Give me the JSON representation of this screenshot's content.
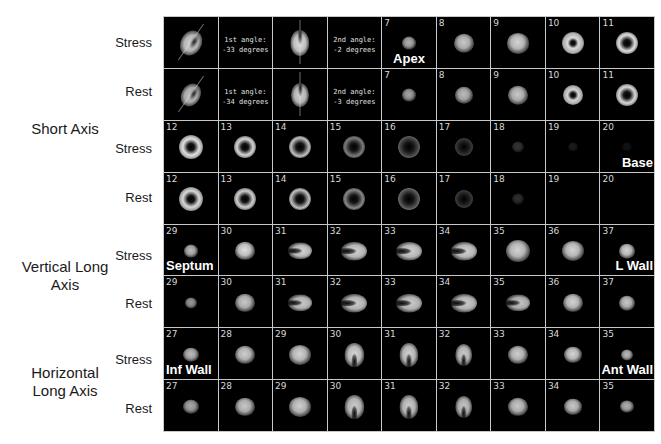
{
  "figure": {
    "group_labels": [
      {
        "id": "short-axis",
        "text": "Short Axis"
      },
      {
        "id": "vertical-long-axis",
        "line1": "Vertical Long",
        "line2": "Axis"
      },
      {
        "id": "horizontal-long-axis",
        "line1": "Horizontal",
        "line2": "Long Axis"
      }
    ],
    "row_labels": [
      "Stress",
      "Rest",
      "Stress",
      "Rest",
      "Stress",
      "Rest",
      "Stress",
      "Rest"
    ],
    "colors": {
      "background": "#ffffff",
      "cell_background": "#000000",
      "grid_lines": "#c8c8c8",
      "label_text": "#1a1a1a",
      "overlay_text": "#ffffff"
    },
    "rows": [
      {
        "label": "Stress",
        "cells": [
          {
            "num": "",
            "shape": "tilted",
            "size": 26,
            "b": 0.9
          },
          {
            "num": "",
            "shape": "text",
            "angle": "1st angle:\n-33 degrees"
          },
          {
            "num": "",
            "shape": "vshape",
            "size": 26,
            "b": 0.95
          },
          {
            "num": "",
            "shape": "text",
            "angle": "2nd angle:\n-2 degrees"
          },
          {
            "num": "7",
            "shape": "blob",
            "size": 14,
            "b": 0.75,
            "tag": "Apex",
            "tagpos": "bottom-center"
          },
          {
            "num": "8",
            "shape": "blob",
            "size": 20,
            "b": 0.85
          },
          {
            "num": "9",
            "shape": "blob",
            "size": 22,
            "b": 0.9
          },
          {
            "num": "10",
            "shape": "ring",
            "size": 22,
            "b": 0.92,
            "hole": 4
          },
          {
            "num": "11",
            "shape": "ring",
            "size": 22,
            "b": 0.95,
            "hole": 6
          }
        ]
      },
      {
        "label": "Rest",
        "cells": [
          {
            "num": "",
            "shape": "tilted",
            "size": 24,
            "b": 0.85
          },
          {
            "num": "",
            "shape": "text",
            "angle": "1st angle:\n-34 degrees"
          },
          {
            "num": "",
            "shape": "vshape",
            "size": 24,
            "b": 0.9
          },
          {
            "num": "",
            "shape": "text",
            "angle": "2nd angle:\n-3 degrees"
          },
          {
            "num": "7",
            "shape": "blob",
            "size": 14,
            "b": 0.7
          },
          {
            "num": "8",
            "shape": "blob",
            "size": 18,
            "b": 0.8
          },
          {
            "num": "9",
            "shape": "blob",
            "size": 20,
            "b": 0.85
          },
          {
            "num": "10",
            "shape": "ring",
            "size": 20,
            "b": 0.9,
            "hole": 4
          },
          {
            "num": "11",
            "shape": "ring",
            "size": 22,
            "b": 0.92,
            "hole": 6
          }
        ]
      },
      {
        "label": "Stress",
        "cells": [
          {
            "num": "12",
            "shape": "ring",
            "size": 24,
            "b": 0.95,
            "hole": 6
          },
          {
            "num": "13",
            "shape": "ring",
            "size": 22,
            "b": 0.9,
            "hole": 6
          },
          {
            "num": "14",
            "shape": "ring",
            "size": 22,
            "b": 0.85,
            "hole": 7
          },
          {
            "num": "15",
            "shape": "ring",
            "size": 22,
            "b": 0.55,
            "hole": 7
          },
          {
            "num": "16",
            "shape": "ring",
            "size": 22,
            "b": 0.4,
            "hole": 8
          },
          {
            "num": "17",
            "shape": "ring",
            "size": 18,
            "b": 0.3,
            "hole": 7
          },
          {
            "num": "18",
            "shape": "blob",
            "size": 12,
            "b": 0.22
          },
          {
            "num": "19",
            "shape": "blob",
            "size": 10,
            "b": 0.12
          },
          {
            "num": "20",
            "shape": "blob",
            "size": 10,
            "b": 0.08,
            "tag": "Base",
            "tagpos": "bottom-right"
          }
        ]
      },
      {
        "label": "Rest",
        "cells": [
          {
            "num": "12",
            "shape": "ring",
            "size": 24,
            "b": 0.92,
            "hole": 6
          },
          {
            "num": "13",
            "shape": "ring",
            "size": 22,
            "b": 0.88,
            "hole": 6
          },
          {
            "num": "14",
            "shape": "ring",
            "size": 22,
            "b": 0.85,
            "hole": 7
          },
          {
            "num": "15",
            "shape": "ring",
            "size": 22,
            "b": 0.6,
            "hole": 7
          },
          {
            "num": "16",
            "shape": "ring",
            "size": 22,
            "b": 0.45,
            "hole": 8
          },
          {
            "num": "17",
            "shape": "ring",
            "size": 18,
            "b": 0.3,
            "hole": 7
          },
          {
            "num": "18",
            "shape": "blob",
            "size": 12,
            "b": 0.2
          },
          {
            "num": "19",
            "shape": "empty"
          },
          {
            "num": "20",
            "shape": "empty"
          }
        ]
      },
      {
        "label": "Stress",
        "cells": [
          {
            "num": "29",
            "shape": "blob",
            "size": 14,
            "b": 0.8,
            "tag": "Septum",
            "tagpos": "bottom-left"
          },
          {
            "num": "30",
            "shape": "blob",
            "size": 20,
            "b": 0.95
          },
          {
            "num": "31",
            "shape": "horse",
            "size": 24,
            "b": 0.92
          },
          {
            "num": "32",
            "shape": "horse",
            "size": 26,
            "b": 0.9
          },
          {
            "num": "33",
            "shape": "horse",
            "size": 26,
            "b": 0.9
          },
          {
            "num": "34",
            "shape": "horse",
            "size": 26,
            "b": 0.9
          },
          {
            "num": "35",
            "shape": "blob",
            "size": 24,
            "b": 0.9
          },
          {
            "num": "36",
            "shape": "blob",
            "size": 22,
            "b": 0.9
          },
          {
            "num": "37",
            "shape": "blob",
            "size": 16,
            "b": 0.9,
            "tag": "L Wall",
            "tagpos": "bottom-right"
          }
        ]
      },
      {
        "label": "Rest",
        "cells": [
          {
            "num": "29",
            "shape": "blob",
            "size": 12,
            "b": 0.65
          },
          {
            "num": "30",
            "shape": "blob",
            "size": 20,
            "b": 0.85
          },
          {
            "num": "31",
            "shape": "horse",
            "size": 24,
            "b": 0.88
          },
          {
            "num": "32",
            "shape": "horse",
            "size": 26,
            "b": 0.88
          },
          {
            "num": "33",
            "shape": "horse",
            "size": 26,
            "b": 0.88
          },
          {
            "num": "34",
            "shape": "horse",
            "size": 26,
            "b": 0.88
          },
          {
            "num": "35",
            "shape": "horse",
            "size": 24,
            "b": 0.85
          },
          {
            "num": "36",
            "shape": "blob",
            "size": 20,
            "b": 0.9
          },
          {
            "num": "37",
            "shape": "blob",
            "size": 16,
            "b": 0.85
          }
        ]
      },
      {
        "label": "Stress",
        "cells": [
          {
            "num": "27",
            "shape": "blob",
            "size": 16,
            "b": 0.8,
            "tag": "Inf Wall",
            "tagpos": "bottom-left"
          },
          {
            "num": "28",
            "shape": "blob",
            "size": 20,
            "b": 0.88
          },
          {
            "num": "29",
            "shape": "blob",
            "size": 22,
            "b": 0.9
          },
          {
            "num": "30",
            "shape": "invU",
            "size": 24,
            "b": 0.92
          },
          {
            "num": "31",
            "shape": "invU",
            "size": 24,
            "b": 0.9
          },
          {
            "num": "32",
            "shape": "invU",
            "size": 22,
            "b": 0.88
          },
          {
            "num": "33",
            "shape": "blob",
            "size": 20,
            "b": 0.88
          },
          {
            "num": "34",
            "shape": "blob",
            "size": 18,
            "b": 0.9
          },
          {
            "num": "35",
            "shape": "blob",
            "size": 12,
            "b": 0.8,
            "tag": "Ant Wall",
            "tagpos": "bottom-right"
          }
        ]
      },
      {
        "label": "Rest",
        "cells": [
          {
            "num": "27",
            "shape": "blob",
            "size": 16,
            "b": 0.72
          },
          {
            "num": "28",
            "shape": "blob",
            "size": 20,
            "b": 0.85
          },
          {
            "num": "29",
            "shape": "blob",
            "size": 22,
            "b": 0.88
          },
          {
            "num": "30",
            "shape": "invU",
            "size": 24,
            "b": 0.88
          },
          {
            "num": "31",
            "shape": "invU",
            "size": 24,
            "b": 0.88
          },
          {
            "num": "32",
            "shape": "invU",
            "size": 22,
            "b": 0.85
          },
          {
            "num": "33",
            "shape": "blob",
            "size": 20,
            "b": 0.85
          },
          {
            "num": "34",
            "shape": "blob",
            "size": 18,
            "b": 0.85
          },
          {
            "num": "35",
            "shape": "blob",
            "size": 14,
            "b": 0.75
          }
        ]
      }
    ]
  }
}
